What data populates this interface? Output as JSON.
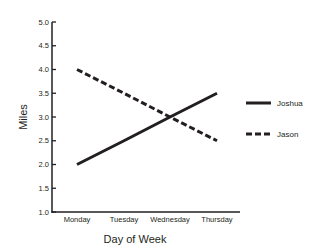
{
  "chart_data": {
    "type": "line",
    "title": "",
    "xlabel": "Day of Week",
    "ylabel": "Miles",
    "categories": [
      "Monday",
      "Tuesday",
      "Wednesday",
      "Thursday"
    ],
    "series": [
      {
        "name": "Joshua",
        "style": "solid",
        "color": "#231f20",
        "values": [
          2.0,
          2.5,
          3.0,
          3.5
        ]
      },
      {
        "name": "Jason",
        "style": "dashed",
        "color": "#231f20",
        "values": [
          4.0,
          3.5,
          3.0,
          2.5
        ]
      }
    ],
    "ylim": [
      1.0,
      5.0
    ],
    "yticks": [
      "1.0",
      "1.5",
      "2.0",
      "2.5",
      "3.0",
      "3.5",
      "4.0",
      "4.5",
      "5.0"
    ],
    "grid": false,
    "legend_position": "right"
  }
}
